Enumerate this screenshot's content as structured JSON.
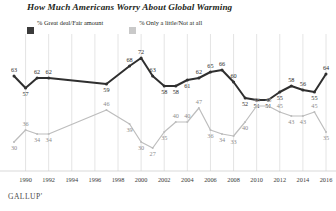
{
  "title": "How Much Americans Worry About Global Warming",
  "brand": "GALLUP'",
  "legend": {
    "items": [
      {
        "label": "% Great deal/Fair amount",
        "color": "#3b3b3b",
        "swatch": "dark-swatch-icon"
      },
      {
        "label": "% Only a little/Not at all",
        "color": "#c9c9c9",
        "swatch": "light-swatch-icon"
      }
    ]
  },
  "axis": {
    "ticks": [
      "1990",
      "1992",
      "1994",
      "1996",
      "1998",
      "2000",
      "2002",
      "2004",
      "2006",
      "2008",
      "2010",
      "2012",
      "2014",
      "2016"
    ]
  },
  "chart_data": {
    "type": "line",
    "title": "How Much Americans Worry About Global Warming",
    "xlabel": "",
    "ylabel": "",
    "ylim": [
      20,
      78
    ],
    "xlim": [
      1989,
      2016
    ],
    "grid": "vertical-only",
    "legend_position": "top-left",
    "x": [
      1989,
      1990,
      1991,
      1992,
      1997,
      1999,
      2000,
      2001,
      2002,
      2003,
      2004,
      2005,
      2006,
      2007,
      2008,
      2009,
      2010,
      2011,
      2012,
      2013,
      2014,
      2015,
      2016
    ],
    "series": [
      {
        "name": "% Great deal/Fair amount",
        "color": "#2f2f2f",
        "values": [
          63,
          57,
          62,
          62,
          59,
          68,
          72,
          63,
          58,
          58,
          61,
          62,
          65,
          66,
          60,
          52,
          51,
          51,
          55,
          58,
          56,
          55,
          64
        ],
        "labels": [
          "63",
          "57",
          "62",
          "62",
          "59",
          "68",
          "72",
          "63",
          "58",
          "58",
          "61",
          "62",
          "65",
          "66",
          "60",
          "52",
          "51",
          "51",
          "55",
          "58",
          "56",
          "55",
          "64"
        ]
      },
      {
        "name": "% Only a little/Not at all",
        "color": "#bdbdbd",
        "values": [
          30,
          36,
          34,
          34,
          46,
          39,
          30,
          27,
          35,
          40,
          40,
          47,
          36,
          34,
          33,
          40,
          48,
          48,
          45,
          43,
          43,
          45,
          35
        ],
        "labels": [
          "30",
          "36",
          "34",
          "34",
          "46",
          "39",
          "30",
          "27",
          "35",
          "40",
          "40",
          "47",
          "36",
          "34",
          "33",
          "40",
          "48",
          "48",
          "45",
          "43",
          "43",
          "45",
          "35"
        ]
      }
    ]
  }
}
